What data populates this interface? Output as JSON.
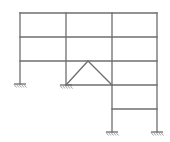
{
  "diagram": {
    "type": "structural-frame",
    "stroke_color": "#6e6e6e",
    "support_color": "#8a8a8a",
    "columns_x": [
      20,
      66,
      112,
      157
    ],
    "levels_y": [
      13,
      37,
      61,
      85,
      109,
      132
    ],
    "members": {
      "beams": [
        {
          "x1": 20,
          "y1": 13,
          "x2": 157,
          "y2": 13
        },
        {
          "x1": 20,
          "y1": 37,
          "x2": 157,
          "y2": 37
        },
        {
          "x1": 20,
          "y1": 61,
          "x2": 157,
          "y2": 61
        },
        {
          "x1": 66,
          "y1": 85,
          "x2": 157,
          "y2": 85
        },
        {
          "x1": 112,
          "y1": 109,
          "x2": 157,
          "y2": 109
        }
      ],
      "columns": [
        {
          "x1": 20,
          "y1": 13,
          "x2": 20,
          "y2": 84
        },
        {
          "x1": 66,
          "y1": 13,
          "x2": 66,
          "y2": 85
        },
        {
          "x1": 112,
          "y1": 13,
          "x2": 112,
          "y2": 132
        },
        {
          "x1": 157,
          "y1": 13,
          "x2": 157,
          "y2": 132
        }
      ],
      "braces": [
        {
          "x1": 66,
          "y1": 85,
          "x2": 88,
          "y2": 61
        },
        {
          "x1": 88,
          "y1": 61,
          "x2": 112,
          "y2": 85
        }
      ]
    },
    "supports": [
      {
        "x": 20,
        "y": 84,
        "type": "fixed"
      },
      {
        "x": 66,
        "y": 85,
        "type": "fixed"
      },
      {
        "x": 112,
        "y": 132,
        "type": "fixed"
      },
      {
        "x": 157,
        "y": 132,
        "type": "fixed"
      }
    ]
  }
}
